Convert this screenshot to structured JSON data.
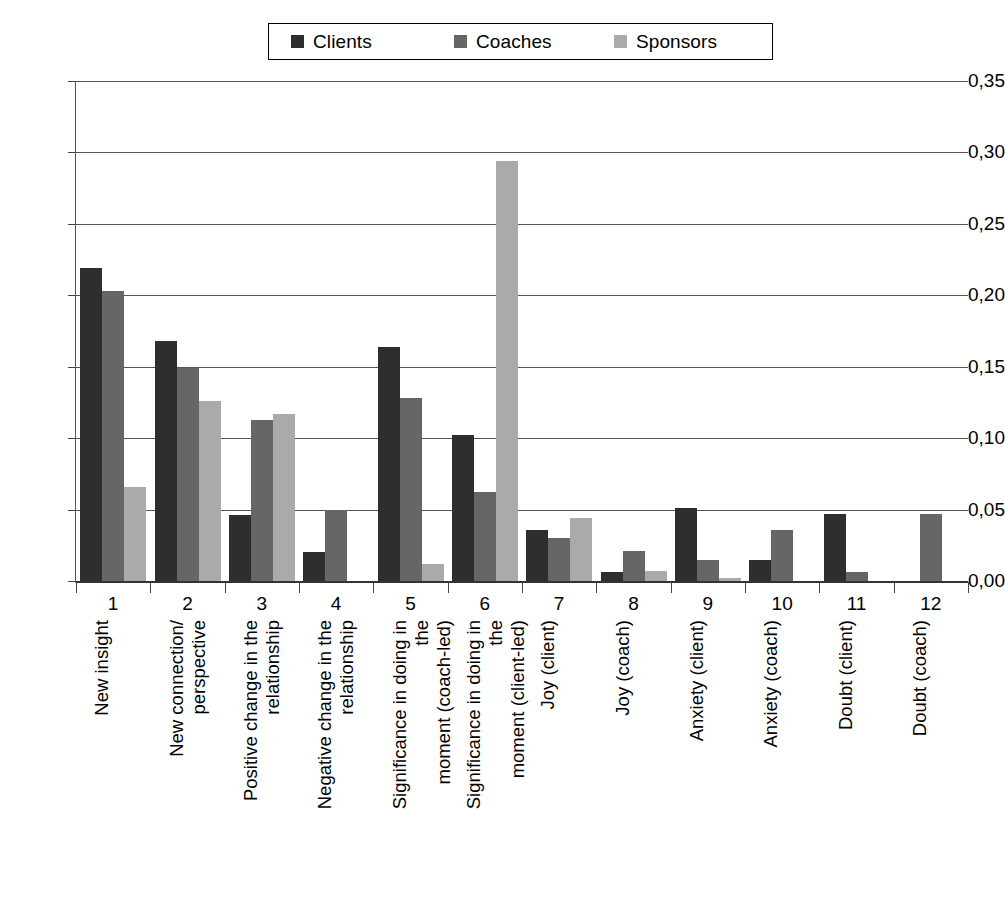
{
  "legend": {
    "entries": [
      {
        "label": "Clients",
        "color": "#2e2e2e"
      },
      {
        "label": "Coaches",
        "color": "#666666"
      },
      {
        "label": "Sponsors",
        "color": "#aaaaaa"
      }
    ]
  },
  "yaxis": {
    "ticks": [
      "0,35",
      "0,30",
      "0,25",
      "0,20",
      "0,15",
      "0,10",
      "0,05",
      "0,00"
    ]
  },
  "xaxis": {
    "numbers": [
      "1",
      "2",
      "3",
      "4",
      "5",
      "6",
      "7",
      "8",
      "9",
      "10",
      "11",
      "12"
    ],
    "categories": [
      "New insight",
      "New connection/\nperspective",
      "Positive change in the\nrelationship",
      "Negative change in the\nrelationship",
      "Significance in doing in the\nmoment (coach-led)",
      "Significance in doing in the\nmoment (client-led)",
      "Joy (client)",
      "Joy (coach)",
      "Anxiety (client)",
      "Anxiety (coach)",
      "Doubt (client)",
      "Doubt (coach)"
    ]
  },
  "chart_data": {
    "type": "bar",
    "title": "",
    "xlabel": "",
    "ylabel": "",
    "ylim": [
      0.0,
      0.35
    ],
    "ytick_step": 0.05,
    "grid": true,
    "legend_position": "top-center",
    "decimal_separator": ",",
    "categories": [
      "New insight",
      "New connection/ perspective",
      "Positive change in the relationship",
      "Negative change in the relationship",
      "Significance in doing in the moment (coach-led)",
      "Significance in doing in the moment (client-led)",
      "Joy (client)",
      "Joy (coach)",
      "Anxiety (client)",
      "Anxiety (coach)",
      "Doubt (client)",
      "Doubt (coach)"
    ],
    "category_numbers": [
      1,
      2,
      3,
      4,
      5,
      6,
      7,
      8,
      9,
      10,
      11,
      12
    ],
    "series": [
      {
        "name": "Clients",
        "color": "#2e2e2e",
        "values": [
          0.219,
          0.168,
          0.046,
          0.02,
          0.164,
          0.102,
          0.036,
          0.006,
          0.051,
          0.015,
          0.047,
          0.0
        ]
      },
      {
        "name": "Coaches",
        "color": "#666666",
        "values": [
          0.203,
          0.149,
          0.113,
          0.05,
          0.128,
          0.062,
          0.03,
          0.021,
          0.015,
          0.036,
          0.006,
          0.047
        ]
      },
      {
        "name": "Sponsors",
        "color": "#aaaaaa",
        "values": [
          0.066,
          0.126,
          0.117,
          0.0,
          0.012,
          0.294,
          0.044,
          0.007,
          0.002,
          0.0,
          0.0,
          0.0
        ]
      }
    ]
  }
}
